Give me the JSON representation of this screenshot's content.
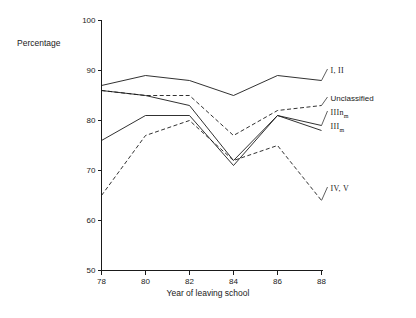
{
  "chart_data": {
    "type": "line",
    "title": "",
    "xlabel": "Year of leaving school",
    "ylabel": "Percentage",
    "x": [
      78,
      80,
      82,
      84,
      86,
      88
    ],
    "xticklabels": [
      "78",
      "80",
      "82",
      "84",
      "86",
      "88"
    ],
    "yticklabels": [
      "50",
      "60",
      "70",
      "80",
      "90",
      "100"
    ],
    "yticks": [
      50,
      60,
      70,
      80,
      90,
      100
    ],
    "xlim": [
      78,
      88
    ],
    "ylim": [
      50,
      100
    ],
    "grid": false,
    "legend_position": "right-inline-end-of-line",
    "series": [
      {
        "name": "I, II",
        "label": "I, II",
        "style": "solid",
        "values": [
          87,
          89,
          88,
          85,
          89,
          88
        ]
      },
      {
        "name": "Unclassified",
        "label": "Unclassified",
        "style": "dashed",
        "values": [
          86,
          85,
          85,
          77,
          82,
          83
        ]
      },
      {
        "name": "IIInm",
        "label": "IIInm",
        "label_main": "IIIn",
        "label_sub": "m",
        "style": "solid",
        "values": [
          86,
          85,
          83,
          72,
          81,
          79
        ]
      },
      {
        "name": "IIIm",
        "label": "IIIm",
        "label_main": "III",
        "label_sub": "m",
        "style": "solid",
        "values": [
          76,
          81,
          81,
          71,
          81,
          78
        ]
      },
      {
        "name": "IV, V",
        "label": "IV, V",
        "style": "dashed",
        "values": [
          65,
          77,
          80,
          72,
          75,
          64
        ]
      }
    ]
  },
  "axes": {
    "y_title": "Percentage",
    "x_title": "Year of leaving school"
  }
}
